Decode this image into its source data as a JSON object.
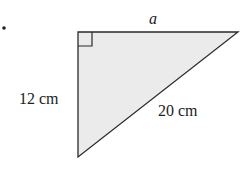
{
  "diagram": {
    "type": "right-triangle",
    "bullet": "•",
    "labels": {
      "top_side": "a",
      "left_side": "12 cm",
      "hypotenuse": "20 cm"
    },
    "colors": {
      "fill": "#ebebeb",
      "stroke": "#2a2a2a",
      "text": "#222222"
    }
  }
}
